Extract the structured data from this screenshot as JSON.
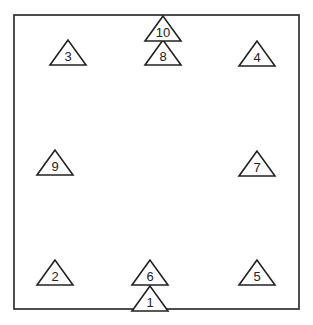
{
  "diagram": {
    "colors": {
      "stroke": "#222222",
      "background": "#ffffff",
      "text": "#222222"
    },
    "box": {
      "x": 14,
      "y": 15,
      "width": 285,
      "height": 294
    },
    "triangles": [
      {
        "label": "1",
        "cx": 150,
        "apex_y": 286,
        "base_y": 311,
        "half_width": 18
      },
      {
        "label": "2",
        "cx": 55,
        "apex_y": 260,
        "base_y": 285,
        "half_width": 18
      },
      {
        "label": "3",
        "cx": 68,
        "apex_y": 40,
        "base_y": 65,
        "half_width": 18
      },
      {
        "label": "4",
        "cx": 257,
        "apex_y": 41,
        "base_y": 66,
        "half_width": 18
      },
      {
        "label": "5",
        "cx": 257,
        "apex_y": 260,
        "base_y": 285,
        "half_width": 18
      },
      {
        "label": "6",
        "cx": 150,
        "apex_y": 260,
        "base_y": 285,
        "half_width": 18
      },
      {
        "label": "7",
        "cx": 257,
        "apex_y": 151,
        "base_y": 176,
        "half_width": 18
      },
      {
        "label": "8",
        "cx": 163,
        "apex_y": 40,
        "base_y": 65,
        "half_width": 18
      },
      {
        "label": "9",
        "cx": 55,
        "apex_y": 150,
        "base_y": 175,
        "half_width": 18
      },
      {
        "label": "10",
        "cx": 163,
        "apex_y": 16,
        "base_y": 41,
        "half_width": 18
      }
    ]
  }
}
